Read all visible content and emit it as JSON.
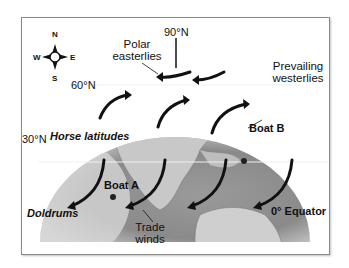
{
  "diagram": {
    "compass": {
      "n": "N",
      "s": "S",
      "e": "E",
      "w": "W"
    },
    "latitudes": {
      "pole": "90°N",
      "lat60": "60°N",
      "lat30": "30°N",
      "equator": "0° Equator"
    },
    "winds": {
      "polar_line1": "Polar",
      "polar_line2": "easterlies",
      "westerlies_line1": "Prevailing",
      "westerlies_line2": "westerlies",
      "trade_line1": "Trade",
      "trade_line2": "winds"
    },
    "zones": {
      "horse": "Horse latitudes",
      "doldrums": "Doldrums"
    },
    "boats": {
      "a": "Boat A",
      "b": "Boat B"
    },
    "colors": {
      "ocean": "#8e8e8e",
      "land": "#c9c9c9",
      "arrow": "#111111",
      "latline": "#f0f0f0"
    }
  }
}
